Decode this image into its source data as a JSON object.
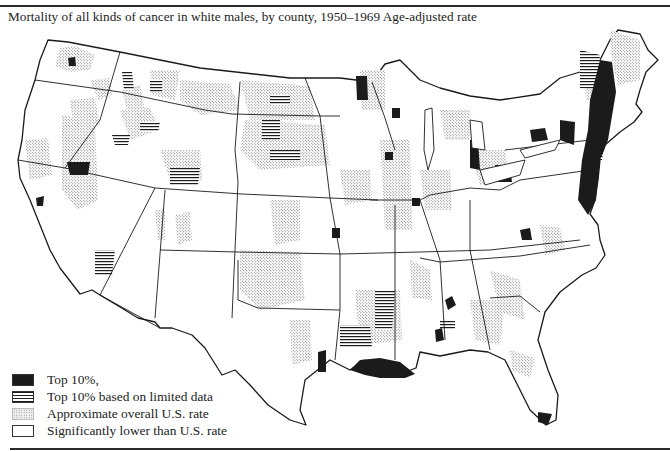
{
  "figure": {
    "title": "Mortality of all kinds of cancer in white males, by county, 1950–1969 Age-adjusted rate"
  },
  "legend": {
    "items": [
      {
        "label": "Top 10%,",
        "pattern": "solid-black",
        "color": "#1b1b1b"
      },
      {
        "label": "Top 10% based on limited data",
        "pattern": "horizontal-hatch",
        "color": "#1b1b1b"
      },
      {
        "label": "Approximate overall U.S. rate",
        "pattern": "stipple",
        "color": "#888888"
      },
      {
        "label": "Significantly lower than U.S. rate",
        "pattern": "white",
        "color": "#ffffff"
      }
    ]
  },
  "map": {
    "region": "Contiguous United States, county-level",
    "colors": {
      "outline": "#1a1a1a",
      "top10": "#1b1b1b",
      "stipple": "#888888",
      "background": "#ffffff"
    },
    "notable_clusters": [
      "Northeast corridor (New York, New Jersey, Massachusetts, Connecticut, Rhode Island) - dense Top 10%",
      "Louisiana Gulf coast - Top 10%",
      "Great Lakes shores (Michigan, Ohio, Wisconsin, Minnesota) - Top 10%",
      "Northern Nevada - Top 10%",
      "South Florida tip - Top 10%"
    ]
  }
}
